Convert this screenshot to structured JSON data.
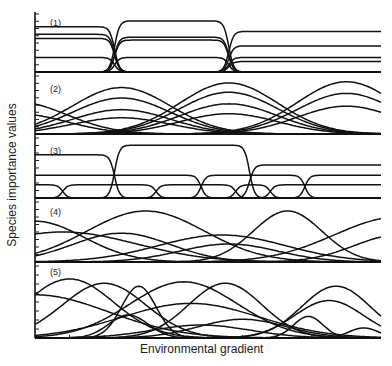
{
  "chart_data": {
    "type": "line",
    "title": "",
    "xlabel": "Environmental gradient",
    "ylabel": "Species importance values",
    "grid": false,
    "legend": null,
    "x_range": [
      0,
      100
    ],
    "panels": [
      {
        "label": "(1)",
        "description": "Discrete communities: plateau-shaped species curves with abrupt simultaneous boundaries",
        "boundaries_x": [
          23,
          56,
          91
        ],
        "series": [
          {
            "name": "zone1-a",
            "x_start": 0,
            "x_end": 23,
            "level": 0.78
          },
          {
            "name": "zone1-b",
            "x_start": 0,
            "x_end": 23,
            "level": 0.65
          },
          {
            "name": "zone1-c",
            "x_start": 0,
            "x_end": 23,
            "level": 0.58
          },
          {
            "name": "zone1-d",
            "x_start": 0,
            "x_end": 23,
            "level": 0.25
          },
          {
            "name": "zone2-a",
            "x_start": 23,
            "x_end": 56,
            "level": 0.88
          },
          {
            "name": "zone2-b",
            "x_start": 23,
            "x_end": 56,
            "level": 0.6
          },
          {
            "name": "zone2-c",
            "x_start": 23,
            "x_end": 56,
            "level": 0.55
          },
          {
            "name": "zone2-d",
            "x_start": 23,
            "x_end": 56,
            "level": 0.25
          },
          {
            "name": "zone3-a",
            "x_start": 56,
            "x_end": 100,
            "level": 0.7
          },
          {
            "name": "zone3-b",
            "x_start": 56,
            "x_end": 100,
            "level": 0.45
          },
          {
            "name": "zone3-c",
            "x_start": 56,
            "x_end": 100,
            "level": 0.25
          },
          {
            "name": "zone3-d",
            "x_start": 56,
            "x_end": 100,
            "level": 0.18
          }
        ]
      },
      {
        "label": "(2)",
        "description": "Groups of bell-shaped curves with coinciding modes (community types)",
        "series": [
          {
            "name": "g0-a",
            "center": -5,
            "width": 20,
            "peak": 0.55
          },
          {
            "name": "g0-b",
            "center": -5,
            "width": 20,
            "peak": 0.35
          },
          {
            "name": "g1-a",
            "center": 25,
            "width": 20,
            "peak": 0.8
          },
          {
            "name": "g1-b",
            "center": 25,
            "width": 20,
            "peak": 0.62
          },
          {
            "name": "g1-c",
            "center": 25,
            "width": 20,
            "peak": 0.42
          },
          {
            "name": "g1-d",
            "center": 25,
            "width": 20,
            "peak": 0.28
          },
          {
            "name": "g2-a",
            "center": 56,
            "width": 20,
            "peak": 0.88
          },
          {
            "name": "g2-b",
            "center": 56,
            "width": 20,
            "peak": 0.72
          },
          {
            "name": "g2-c",
            "center": 56,
            "width": 20,
            "peak": 0.52
          },
          {
            "name": "g2-d",
            "center": 56,
            "width": 20,
            "peak": 0.35
          },
          {
            "name": "g3-a",
            "center": 90,
            "width": 20,
            "peak": 0.9
          },
          {
            "name": "g3-b",
            "center": 90,
            "width": 20,
            "peak": 0.7
          },
          {
            "name": "g3-c",
            "center": 90,
            "width": 20,
            "peak": 0.48
          }
        ]
      },
      {
        "label": "(3)",
        "description": "Plateau curves with boundaries that do not coincide (dominants and subordinates)",
        "series": [
          {
            "name": "dom-1",
            "x_start": 0,
            "x_end": 23,
            "level": 0.72
          },
          {
            "name": "dom-2",
            "x_start": 23,
            "x_end": 62,
            "level": 0.88
          },
          {
            "name": "dom-3",
            "x_start": 62,
            "x_end": 100,
            "level": 0.55
          },
          {
            "name": "sub-1",
            "x_start": 0,
            "x_end": 48,
            "level": 0.38
          },
          {
            "name": "sub-2",
            "x_start": 48,
            "x_end": 78,
            "level": 0.38
          },
          {
            "name": "sub-3",
            "x_start": 78,
            "x_end": 100,
            "level": 0.38
          },
          {
            "name": "low-1",
            "x_start": 0,
            "x_end": 8,
            "level": 0.22
          },
          {
            "name": "low-2",
            "x_start": 8,
            "x_end": 35,
            "level": 0.22
          },
          {
            "name": "low-3",
            "x_start": 35,
            "x_end": 58,
            "level": 0.22
          },
          {
            "name": "low-4",
            "x_start": 58,
            "x_end": 68,
            "level": 0.22
          },
          {
            "name": "low-5",
            "x_start": 68,
            "x_end": 100,
            "level": 0.22
          }
        ]
      },
      {
        "label": "(4)",
        "description": "Bell-shaped curves with independently distributed modes (continuum)",
        "series": [
          {
            "name": "s1",
            "center": 0,
            "width": 20,
            "peak": 0.68
          },
          {
            "name": "s2",
            "center": 32,
            "width": 24,
            "peak": 0.85
          },
          {
            "name": "s3",
            "center": 25,
            "width": 20,
            "peak": 0.48
          },
          {
            "name": "s4",
            "center": 8,
            "width": 30,
            "peak": 0.5
          },
          {
            "name": "s5",
            "center": 54,
            "width": 26,
            "peak": 0.45
          },
          {
            "name": "s6",
            "center": 56,
            "width": 20,
            "peak": 0.3
          },
          {
            "name": "s7",
            "center": 73,
            "width": 14,
            "peak": 0.85
          },
          {
            "name": "s8",
            "center": 105,
            "width": 26,
            "peak": 0.75
          },
          {
            "name": "s9",
            "center": 105,
            "width": 18,
            "peak": 0.45
          }
        ]
      },
      {
        "label": "(5)",
        "description": "Skewed curves of varied width and height with independent modes",
        "series": [
          {
            "name": "t1",
            "center": 10,
            "width": 18,
            "peak": 0.82
          },
          {
            "name": "t2",
            "center": 20,
            "width": 17,
            "peak": 0.76
          },
          {
            "name": "t3",
            "center": 30,
            "width": 7,
            "peak": 0.72
          },
          {
            "name": "t4",
            "center": 45,
            "width": 28,
            "peak": 0.48
          },
          {
            "name": "t5",
            "center": 43,
            "width": 22,
            "peak": 0.78
          },
          {
            "name": "t6",
            "center": 55,
            "width": 15,
            "peak": 0.76
          },
          {
            "name": "t7",
            "center": 48,
            "width": 20,
            "peak": 0.18
          },
          {
            "name": "t8",
            "center": 60,
            "width": 18,
            "peak": 0.26
          },
          {
            "name": "t9",
            "center": 87,
            "width": 14,
            "peak": 0.72
          },
          {
            "name": "t10",
            "center": 85,
            "width": 14,
            "peak": 0.52
          },
          {
            "name": "t11",
            "center": 79,
            "width": 6,
            "peak": 0.3
          },
          {
            "name": "t12",
            "center": 95,
            "width": 6,
            "peak": 0.14
          },
          {
            "name": "t13",
            "center": 0,
            "width": 30,
            "peak": 0.6
          },
          {
            "name": "t14",
            "center": 27,
            "width": 8,
            "peak": 0.32
          }
        ]
      }
    ]
  },
  "labels": {
    "ylabel": "Species importance values",
    "xlabel": "Environmental gradient",
    "panels": [
      "(1)",
      "(2)",
      "(3)",
      "(4)",
      "(5)"
    ]
  }
}
